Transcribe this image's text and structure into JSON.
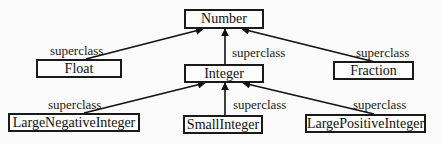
{
  "diagram": {
    "type": "class-hierarchy",
    "nodes": {
      "number": {
        "label": "Number"
      },
      "float": {
        "label": "Float"
      },
      "integer": {
        "label": "Integer"
      },
      "fraction": {
        "label": "Fraction"
      },
      "large_negative_integer": {
        "label": "LargeNegativeInteger"
      },
      "small_integer": {
        "label": "SmallInteger"
      },
      "large_positive_integer": {
        "label": "LargePositiveInteger"
      }
    },
    "edges": [
      {
        "from": "Float",
        "to": "Number",
        "label": "superclass"
      },
      {
        "from": "Integer",
        "to": "Number",
        "label": "superclass"
      },
      {
        "from": "Fraction",
        "to": "Number",
        "label": "superclass"
      },
      {
        "from": "LargeNegativeInteger",
        "to": "Integer",
        "label": "superclass"
      },
      {
        "from": "SmallInteger",
        "to": "Integer",
        "label": "superclass"
      },
      {
        "from": "LargePositiveInteger",
        "to": "Integer",
        "label": "superclass"
      }
    ],
    "edge_labels": {
      "float_number": "superclass",
      "integer_number": "superclass",
      "fraction_number": "superclass",
      "lni_integer": "superclass",
      "si_integer": "superclass",
      "lpi_integer": "superclass"
    },
    "colors": {
      "line": "#111111",
      "box_border": "#1a1a1a",
      "background": "#fbfbfb"
    }
  }
}
